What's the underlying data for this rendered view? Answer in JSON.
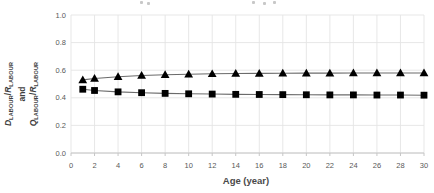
{
  "page": {
    "background": "#ffffff"
  },
  "chart_data": {
    "type": "line",
    "x": [
      1,
      2,
      4,
      6,
      8,
      10,
      12,
      14,
      16,
      18,
      20,
      22,
      24,
      26,
      28,
      30
    ],
    "series": [
      {
        "name": "triangle-series",
        "marker": "triangle",
        "values": [
          0.53,
          0.54,
          0.553,
          0.562,
          0.567,
          0.571,
          0.574,
          0.576,
          0.577,
          0.578,
          0.579,
          0.579,
          0.58,
          0.58,
          0.58,
          0.58
        ]
      },
      {
        "name": "square-series",
        "marker": "square",
        "values": [
          0.462,
          0.453,
          0.443,
          0.437,
          0.432,
          0.429,
          0.427,
          0.425,
          0.424,
          0.423,
          0.422,
          0.421,
          0.421,
          0.42,
          0.42,
          0.419
        ]
      }
    ],
    "xlabel": "Age (year)",
    "ylabel_plain": "D_LABOUR/R_LABOUR and Q_LABOUR/R_LABOUR",
    "ylabel_lines": [
      {
        "segments": [
          {
            "text": "D",
            "style": "var"
          },
          {
            "text": "LABOUR",
            "style": "sub"
          },
          {
            "text": "/",
            "style": "plain"
          },
          {
            "text": "R",
            "style": "var"
          },
          {
            "text": "LABOUR",
            "style": "sub"
          }
        ]
      },
      {
        "segments": [
          {
            "text": "and",
            "style": "plain"
          }
        ]
      },
      {
        "segments": [
          {
            "text": "Q",
            "style": "var"
          },
          {
            "text": "LABOUR",
            "style": "sub"
          },
          {
            "text": "/",
            "style": "plain"
          },
          {
            "text": "R",
            "style": "var"
          },
          {
            "text": "LABOUR",
            "style": "sub"
          }
        ]
      }
    ],
    "xlim": [
      0,
      30
    ],
    "ylim": [
      0,
      1
    ],
    "x_ticks": [
      "0",
      "2",
      "4",
      "6",
      "8",
      "10",
      "12",
      "14",
      "16",
      "18",
      "20",
      "22",
      "24",
      "26",
      "28",
      "30"
    ],
    "y_ticks": [
      "0.0",
      "0.2",
      "0.4",
      "0.6",
      "0.8",
      "1.0"
    ],
    "grid": true,
    "legend": "none",
    "colors": {
      "marker": "#000000",
      "line": "#6b6b6b",
      "grid": "#e4e4e4",
      "axis": "#c6c6c6",
      "tick_text": "#595959"
    }
  }
}
